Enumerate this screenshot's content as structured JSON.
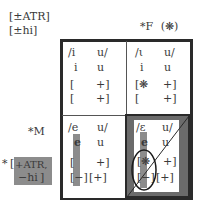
{
  "labels": {
    "feature_atr": "[±ATR]",
    "feature_hi": "[±hi]",
    "constraint_f": "*F",
    "constraint_f_mark": "(❋)",
    "constraint_m": "*M",
    "star_prefix": "*",
    "bracket_open": "[",
    "bracket_close": "]",
    "constraint_feature_1": "+ATR,",
    "constraint_feature_2": "−hi"
  },
  "cells": {
    "top_left": {
      "underlying": [
        "/i",
        "u/"
      ],
      "surface": [
        "i",
        "u"
      ],
      "row_atr": [
        "[",
        "+]"
      ],
      "row_hi": [
        "[",
        "+]"
      ]
    },
    "top_right": {
      "underlying": [
        "/ι",
        "u/"
      ],
      "surface": [
        "i",
        "u"
      ],
      "row_atr": [
        "[❋",
        "+]"
      ],
      "row_hi": [
        "[",
        "+]"
      ]
    },
    "bottom_left": {
      "underlying": [
        "/e",
        "u/"
      ],
      "surface": [
        "e",
        "u"
      ],
      "row_atr": [
        "[",
        "+]"
      ],
      "row_hi": [
        "[−]",
        "[+]"
      ]
    },
    "bottom_right": {
      "underlying": [
        "/ɛ",
        "u/"
      ],
      "surface": [
        "e",
        "u"
      ],
      "row_atr": [
        "[❋",
        "+]"
      ],
      "row_hi": [
        "[−]",
        "[+]"
      ]
    }
  },
  "colors": {
    "frame": "#2a2a2a",
    "highlight": "#8c8c8c",
    "shaded_cell": "#6b6b6b",
    "text": "#3a3a3a"
  }
}
